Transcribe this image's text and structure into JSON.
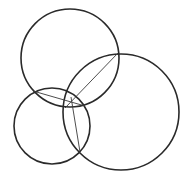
{
  "diagram": {
    "title": "",
    "background": "#ffffff",
    "stroke_color": "#2a2a2a",
    "circles": [
      {
        "name": "top-circle",
        "cx": 70,
        "cy": 58,
        "r": 49
      },
      {
        "name": "right-circle",
        "cx": 121,
        "cy": 112,
        "r": 58
      },
      {
        "name": "left-circle",
        "cx": 52,
        "cy": 126,
        "r": 38
      }
    ],
    "chords": [
      {
        "name": "chord-top-right",
        "x1": 118,
        "y1": 53,
        "x2": 65,
        "y2": 108
      },
      {
        "name": "chord-top-left",
        "x1": 33,
        "y1": 91,
        "x2": 85,
        "y2": 106
      },
      {
        "name": "chord-left-right",
        "x1": 71,
        "y1": 97,
        "x2": 80,
        "y2": 152
      }
    ]
  }
}
